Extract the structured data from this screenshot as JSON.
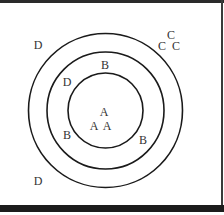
{
  "diagram": {
    "type": "concentric-circles",
    "circles": [
      {
        "name": "outer",
        "cx": 105.5,
        "cy": 110.5,
        "r": 77
      },
      {
        "name": "middle",
        "cx": 105.5,
        "cy": 110.5,
        "r": 58.5
      },
      {
        "name": "inner",
        "cx": 105.5,
        "cy": 110.5,
        "r": 37.5
      }
    ],
    "labels": [
      {
        "text": "D",
        "x": 38,
        "y": 49
      },
      {
        "text": "C",
        "x": 171,
        "y": 39
      },
      {
        "text": "C",
        "x": 162,
        "y": 50
      },
      {
        "text": "C",
        "x": 176,
        "y": 50
      },
      {
        "text": "B",
        "x": 105,
        "y": 69
      },
      {
        "text": "D",
        "x": 67,
        "y": 86
      },
      {
        "text": "A",
        "x": 104,
        "y": 116
      },
      {
        "text": "A",
        "x": 94,
        "y": 130
      },
      {
        "text": "A",
        "x": 107,
        "y": 130
      },
      {
        "text": "B",
        "x": 67,
        "y": 139
      },
      {
        "text": "B",
        "x": 143,
        "y": 144
      },
      {
        "text": "D",
        "x": 38,
        "y": 185
      }
    ]
  }
}
